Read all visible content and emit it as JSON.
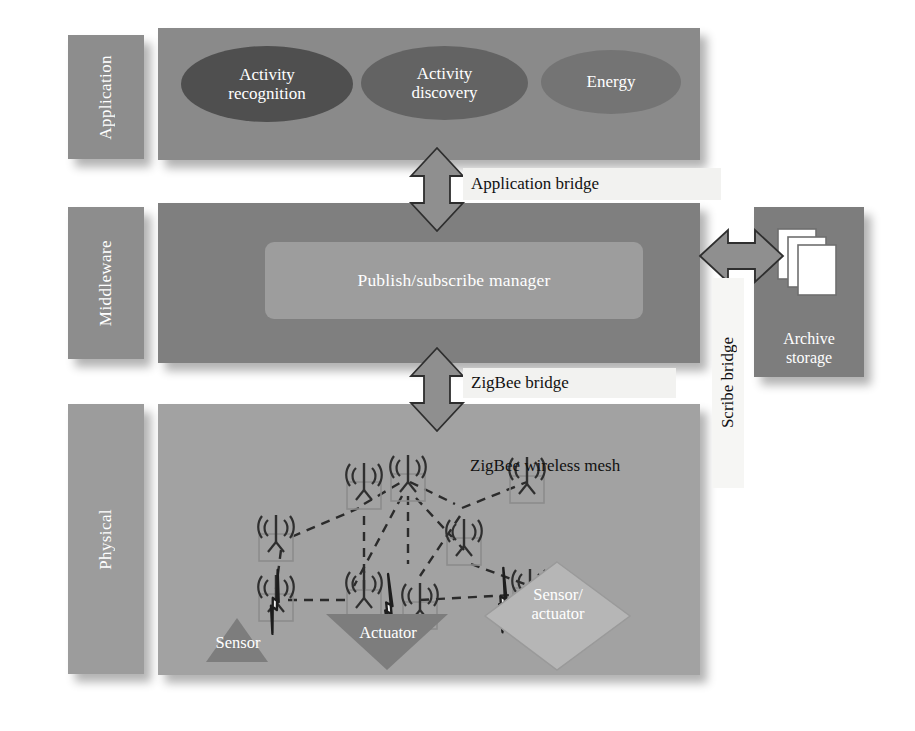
{
  "diagram": {
    "layers": [
      {
        "id": "application",
        "label": "Application"
      },
      {
        "id": "middleware",
        "label": "Middleware"
      },
      {
        "id": "physical",
        "label": "Physical"
      }
    ],
    "application": {
      "components": [
        {
          "name": "activity-recognition",
          "label": "Activity\nrecognition",
          "line1": "Activity",
          "line2": "recognition",
          "shape": "ellipse",
          "fill": "#4f4f4f"
        },
        {
          "name": "activity-discovery",
          "label": "Activity\ndiscovery",
          "line1": "Activity",
          "line2": "discovery",
          "shape": "ellipse",
          "fill": "#636363"
        },
        {
          "name": "energy",
          "label": "Energy",
          "line1": "Energy",
          "line2": "",
          "shape": "ellipse",
          "fill": "#747474"
        }
      ]
    },
    "middleware": {
      "manager_label": "Publish/subscribe manager",
      "archive": {
        "line1": "Archive",
        "line2": "storage",
        "icon": "document-stack-icon"
      }
    },
    "physical": {
      "mesh_label": "ZigBee wireless mesh",
      "node_icon": "wireless-node-icon",
      "node_count": 9,
      "device_shapes": [
        {
          "name": "sensor",
          "label": "Sensor",
          "shape": "triangle-up",
          "line1": "Sensor",
          "line2": ""
        },
        {
          "name": "actuator",
          "label": "Actuator",
          "shape": "triangle-down",
          "line1": "Actuator",
          "line2": ""
        },
        {
          "name": "sensor-actuator",
          "label": "Sensor/\nactuator",
          "shape": "diamond",
          "line1": "Sensor/",
          "line2": "actuator"
        }
      ],
      "link_icon": "lightning-bolt-icon"
    },
    "bridges": [
      {
        "name": "application-bridge",
        "label": "Application bridge",
        "orientation": "horizontal",
        "arrow": "double-arrow-vertical"
      },
      {
        "name": "zigbee-bridge",
        "label": "ZigBee bridge",
        "orientation": "horizontal",
        "arrow": "double-arrow-vertical"
      },
      {
        "name": "scribe-bridge",
        "label": "Scribe bridge",
        "orientation": "vertical",
        "arrow": "double-arrow-horizontal"
      }
    ],
    "colors": {
      "application_body": "#8a8a8a",
      "middleware_body": "#7f7f7f",
      "physical_body": "#a2a2a2",
      "label_bar": "#8d8d8d",
      "manager_box": "#9d9d9d",
      "archive_box": "#7d7d7d",
      "strip_label": "#f2f2f0",
      "text_light": "#ffffff",
      "text_dark": "#111111"
    }
  }
}
